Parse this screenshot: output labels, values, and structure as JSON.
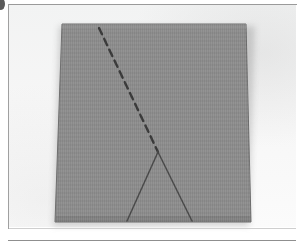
{
  "figure": {
    "caption": "",
    "label": "",
    "background_color": "#f7f7f7",
    "frame_color": "#9a9a9a"
  },
  "scene": {
    "description": "Photograph of a gray rectangular card lying on a white surface, marked with a hand-drawn dashed line and a triangle",
    "surface_color": "#f6f6f6"
  },
  "card": {
    "name": "gray-paper-sheet",
    "fill_color": "#8b8b8b",
    "edge_color": "#6f6f6f",
    "shadow_color": "#787878",
    "corners": {
      "top_left": [
        62,
        24
      ],
      "top_right": [
        246,
        24
      ],
      "bottom_right": [
        251,
        222
      ],
      "bottom_left": [
        55,
        222
      ]
    }
  },
  "markings": {
    "dashed_line": {
      "name": "dashed-fold-line",
      "color": "#3a3a3a",
      "style": "dashed",
      "start": [
        99,
        28
      ],
      "end": [
        158,
        152
      ],
      "dash_count": 11
    },
    "triangle": {
      "name": "drawn-triangle",
      "color": "#4a4a4a",
      "style": "solid",
      "apex": [
        158,
        152
      ],
      "base_left": [
        127,
        221
      ],
      "base_right": [
        192,
        221
      ]
    }
  },
  "artifacts": {
    "corner_mark": {
      "name": "scan-artifact",
      "color": "#5b5b5b",
      "position": [
        0,
        0
      ]
    }
  }
}
